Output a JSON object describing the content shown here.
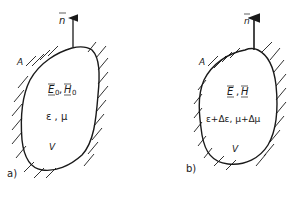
{
  "figure": {
    "panels": [
      {
        "id": "a",
        "label": "a)",
        "normal_label": "n",
        "surface_label": "A",
        "fields_E": "E",
        "fields_E_sub": "0",
        "fields_sep": ",",
        "fields_H": "H",
        "fields_H_sub": "0",
        "material": "ε , μ",
        "volume_label": "V"
      },
      {
        "id": "b",
        "label": "b)",
        "normal_label": "n",
        "surface_label": "A",
        "fields_E": "E",
        "fields_sep": ",",
        "fields_H": "H",
        "material": "ε+Δε, μ+Δμ",
        "volume_label": "V"
      }
    ]
  }
}
